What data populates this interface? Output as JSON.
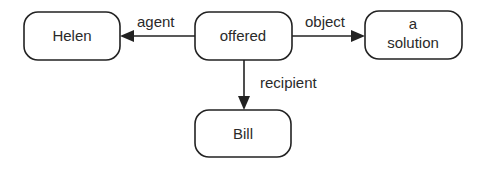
{
  "diagram": {
    "type": "semantic-network",
    "nodes": [
      {
        "id": "helen",
        "lines": [
          "Helen"
        ]
      },
      {
        "id": "offered",
        "lines": [
          "offered"
        ]
      },
      {
        "id": "solution",
        "lines": [
          "a",
          "solution"
        ]
      },
      {
        "id": "bill",
        "lines": [
          "Bill"
        ]
      }
    ],
    "edges": [
      {
        "from": "offered",
        "to": "helen",
        "label": "agent"
      },
      {
        "from": "offered",
        "to": "solution",
        "label": "object"
      },
      {
        "from": "offered",
        "to": "bill",
        "label": "recipient"
      }
    ],
    "colors": {
      "stroke": "#222222",
      "text": "#2a2a2a",
      "background": "#ffffff"
    }
  }
}
